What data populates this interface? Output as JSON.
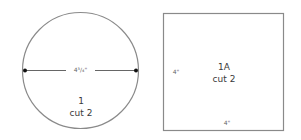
{
  "diagram": {
    "pieces": [
      {
        "shape": "circle",
        "number": "1",
        "cut": "cut 2",
        "dimension": "4³/₄\""
      },
      {
        "shape": "square",
        "number": "1A",
        "cut": "cut 2",
        "dimension_side": "4\"",
        "dimension_bottom": "4\""
      }
    ],
    "colors": {
      "outline": "#8a8a8a",
      "dimension_line": "#555555",
      "dot": "#111111"
    }
  }
}
